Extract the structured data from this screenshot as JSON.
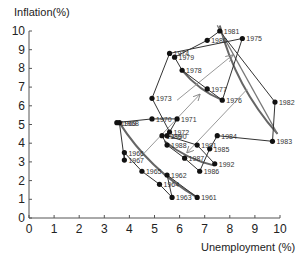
{
  "chart_data": {
    "type": "line",
    "title": "",
    "xlabel": "Unemployment (%)",
    "ylabel": "Inflation(%)",
    "xlim": [
      0,
      10
    ],
    "ylim": [
      0,
      10
    ],
    "x_ticks": [
      "0",
      "1",
      "2",
      "3",
      "4",
      "5",
      "6",
      "7",
      "8",
      "9",
      "10"
    ],
    "y_ticks": [
      "0",
      "1",
      "2",
      "3",
      "4",
      "5",
      "6",
      "7",
      "8",
      "9",
      "10"
    ],
    "grid": false,
    "legend": null,
    "series": [
      {
        "name": "US inflation vs unemployment 1961-1992",
        "points": [
          {
            "year": "1961",
            "x": 6.7,
            "y": 1.1
          },
          {
            "year": "1962",
            "x": 5.5,
            "y": 2.3
          },
          {
            "year": "1963",
            "x": 5.7,
            "y": 1.1
          },
          {
            "year": "1964",
            "x": 5.2,
            "y": 1.8
          },
          {
            "year": "1965",
            "x": 4.5,
            "y": 2.5
          },
          {
            "year": "1966",
            "x": 3.8,
            "y": 3.5
          },
          {
            "year": "1967",
            "x": 3.8,
            "y": 3.1
          },
          {
            "year": "1968",
            "x": 3.6,
            "y": 5.1
          },
          {
            "year": "1969",
            "x": 3.5,
            "y": 5.1
          },
          {
            "year": "1970",
            "x": 4.9,
            "y": 5.3
          },
          {
            "year": "1971",
            "x": 5.9,
            "y": 5.3
          },
          {
            "year": "1972",
            "x": 5.6,
            "y": 4.6
          },
          {
            "year": "1973",
            "x": 4.9,
            "y": 6.4
          },
          {
            "year": "1974",
            "x": 5.6,
            "y": 8.8
          },
          {
            "year": "1975",
            "x": 8.5,
            "y": 9.6
          },
          {
            "year": "1976",
            "x": 7.7,
            "y": 6.3
          },
          {
            "year": "1977",
            "x": 7.1,
            "y": 6.9
          },
          {
            "year": "1978",
            "x": 6.1,
            "y": 7.9
          },
          {
            "year": "1979",
            "x": 5.8,
            "y": 8.6
          },
          {
            "year": "1980",
            "x": 7.1,
            "y": 9.5
          },
          {
            "year": "1981",
            "x": 7.6,
            "y": 10.0
          },
          {
            "year": "1982",
            "x": 9.8,
            "y": 6.2
          },
          {
            "year": "1983",
            "x": 9.7,
            "y": 4.1
          },
          {
            "year": "1984",
            "x": 7.5,
            "y": 4.4
          },
          {
            "year": "1985",
            "x": 7.2,
            "y": 3.7
          },
          {
            "year": "1986",
            "x": 6.8,
            "y": 2.5
          },
          {
            "year": "1987",
            "x": 6.2,
            "y": 3.2
          },
          {
            "year": "1988",
            "x": 5.5,
            "y": 3.9
          },
          {
            "year": "1989",
            "x": 5.3,
            "y": 4.4
          },
          {
            "year": "1990",
            "x": 5.5,
            "y": 4.4
          },
          {
            "year": "1991",
            "x": 6.7,
            "y": 3.9
          },
          {
            "year": "1992",
            "x": 7.4,
            "y": 2.9
          }
        ]
      }
    ],
    "annotations": [
      {
        "type": "curve",
        "desc": "short-run Phillips curve 1960s",
        "from": [
          3.6,
          5.1
        ],
        "to": [
          6.7,
          1.1
        ]
      },
      {
        "type": "curve",
        "desc": "short-run Phillips curve late 1980s",
        "from": [
          5.4,
          4.1
        ],
        "to": [
          7.4,
          2.8
        ]
      },
      {
        "type": "curve",
        "desc": "short-run Phillips curve late 1970s",
        "from": [
          6.1,
          7.9
        ],
        "to": [
          7.7,
          6.3
        ]
      },
      {
        "type": "curve",
        "desc": "short-run Phillips curve early 1980s",
        "from": [
          7.6,
          10.3
        ],
        "to": [
          9.9,
          4.5
        ]
      },
      {
        "type": "arrow",
        "desc": "upward shift",
        "from": [
          4.4,
          3.2
        ],
        "to": [
          6.8,
          6.6
        ]
      },
      {
        "type": "arrow",
        "desc": "upward shift",
        "from": [
          5.9,
          6.3
        ],
        "to": [
          8.1,
          8.7
        ]
      },
      {
        "type": "arrow",
        "desc": "downward shift",
        "from": [
          8.7,
          6.9
        ],
        "to": [
          6.3,
          3.5
        ]
      }
    ]
  },
  "labels": {
    "ylabel": "Inflation(%)",
    "xlabel": "Unemployment (%)"
  }
}
